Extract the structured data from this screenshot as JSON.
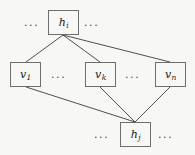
{
  "figure": {
    "type": "layered-graph-diagram",
    "background_color": "#f7f7f5",
    "node_border_color": "#6e6e6e",
    "edge_color": "#3c3c3c",
    "text_color": "#1a1a1a",
    "width": 195,
    "height": 155
  },
  "nodes": [
    {
      "id": "h_i",
      "base": "h",
      "subscript": "i",
      "label": "h",
      "layer": "top",
      "x": 48,
      "y": 10,
      "w": 31,
      "h": 25
    },
    {
      "id": "v_1",
      "base": "v",
      "subscript": "1",
      "label": "v",
      "layer": "middle",
      "x": 10,
      "y": 62,
      "w": 31,
      "h": 25
    },
    {
      "id": "v_k",
      "base": "v",
      "subscript": "k",
      "label": "v",
      "layer": "middle",
      "x": 85,
      "y": 62,
      "w": 31,
      "h": 25
    },
    {
      "id": "v_n",
      "base": "v",
      "subscript": "n",
      "label": "v",
      "layer": "middle",
      "x": 155,
      "y": 62,
      "w": 31,
      "h": 25
    },
    {
      "id": "h_j",
      "base": "h",
      "subscript": "j",
      "label": "h",
      "layer": "bottom",
      "x": 120,
      "y": 122,
      "w": 31,
      "h": 25
    }
  ],
  "edges": [
    {
      "id": "edge-hi-v1",
      "from": "h_i",
      "to": "v_1",
      "x1": 63,
      "y1": 35,
      "x2": 26,
      "y2": 62
    },
    {
      "id": "edge-hi-vk",
      "from": "h_i",
      "to": "v_k",
      "x1": 63,
      "y1": 35,
      "x2": 100,
      "y2": 62
    },
    {
      "id": "edge-hi-vn",
      "from": "h_i",
      "to": "v_n",
      "x1": 63,
      "y1": 35,
      "x2": 170,
      "y2": 62
    },
    {
      "id": "edge-v1-hj",
      "from": "v_1",
      "to": "h_j",
      "x1": 26,
      "y1": 87,
      "x2": 135,
      "y2": 122
    },
    {
      "id": "edge-vk-hj",
      "from": "v_k",
      "to": "h_j",
      "x1": 100,
      "y1": 87,
      "x2": 135,
      "y2": 122
    },
    {
      "id": "edge-vn-hj",
      "from": "v_n",
      "to": "h_j",
      "x1": 170,
      "y1": 87,
      "x2": 135,
      "y2": 122
    }
  ],
  "ellipses": [
    {
      "id": "ellipsis-top-left",
      "text": "...",
      "x": 24,
      "y": 17
    },
    {
      "id": "ellipsis-top-right",
      "text": "...",
      "x": 84,
      "y": 17
    },
    {
      "id": "ellipsis-middle-left",
      "text": "...",
      "x": 51,
      "y": 69
    },
    {
      "id": "ellipsis-middle-right",
      "text": "...",
      "x": 125,
      "y": 69
    },
    {
      "id": "ellipsis-bottom-left",
      "text": "...",
      "x": 94,
      "y": 129
    },
    {
      "id": "ellipsis-bottom-right",
      "text": "...",
      "x": 158,
      "y": 129
    }
  ]
}
